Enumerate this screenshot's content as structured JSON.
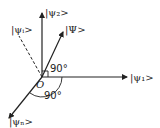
{
  "diagram": {
    "origin_label": "O",
    "axes": {
      "horizontal": {
        "label": "|ψ₁>"
      },
      "vertical": {
        "label": "|ψ₂>"
      }
    },
    "vectors": {
      "state": {
        "label": "|Ψ>"
      },
      "dashed": {
        "label": "|ψᵢ>"
      },
      "lower": {
        "label": "|ψₙ>"
      }
    },
    "angles": {
      "right_angle": {
        "label": "90°"
      },
      "arc": {
        "label": "90°"
      }
    },
    "colors": {
      "stroke": "#222222",
      "background": "#ffffff"
    }
  }
}
